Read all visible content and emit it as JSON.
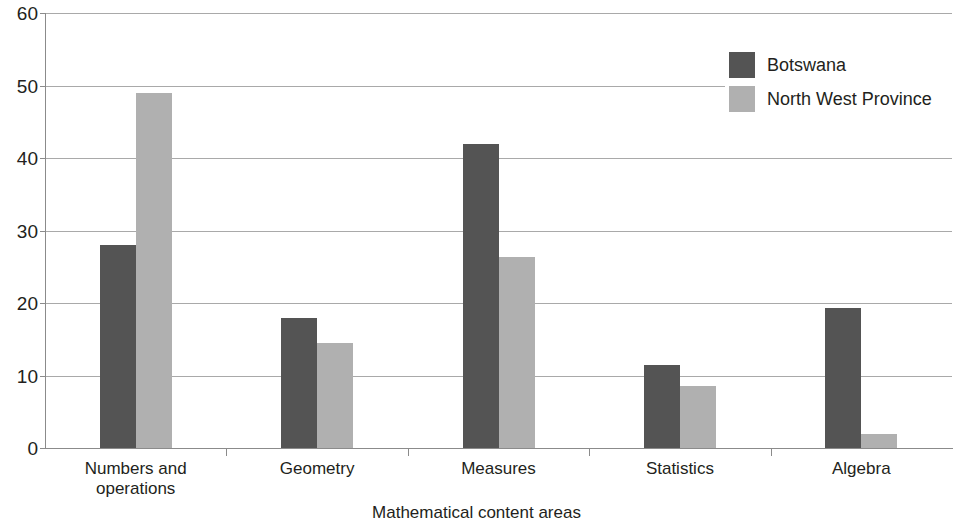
{
  "chart_data": {
    "type": "bar",
    "title": "",
    "subtitle": "",
    "xlabel": "Mathematical content areas",
    "ylabel": "",
    "categories": [
      "Numbers and operations",
      "Geometry",
      "Measures",
      "Statistics",
      "Algebra"
    ],
    "series": [
      {
        "name": "Botswana",
        "color": "#545454",
        "values": [
          28,
          18,
          42,
          11.5,
          19.3
        ]
      },
      {
        "name": "North West Province",
        "color": "#b0b0b0",
        "values": [
          49,
          14.5,
          26.3,
          8.5,
          2
        ]
      }
    ],
    "ylim": [
      0,
      60
    ],
    "yticks": [
      0,
      10,
      20,
      30,
      40,
      50,
      60
    ],
    "ytick_labels": [
      "0",
      "10",
      "20",
      "30",
      "40",
      "50",
      "60"
    ],
    "grid": true,
    "grid_axis": "y",
    "legend_position": "top-right",
    "category_label_lines": [
      [
        "Numbers and",
        "operations"
      ],
      [
        "Geometry"
      ],
      [
        "Measures"
      ],
      [
        "Statistics"
      ],
      [
        "Algebra"
      ]
    ]
  },
  "legend": {
    "entries": [
      {
        "label": "Botswana",
        "color": "#545454"
      },
      {
        "label": "North West Province",
        "color": "#b0b0b0"
      }
    ]
  },
  "axes": {
    "x_title": "Mathematical content areas",
    "y_tick_labels": [
      "60",
      "50",
      "40",
      "30",
      "20",
      "10",
      "0"
    ]
  },
  "colors": {
    "series_dark": "#545454",
    "series_light": "#b0b0b0",
    "gridline": "#a9a9a9",
    "axis": "#8b8b8b",
    "text": "#231f20",
    "background": "#ffffff"
  }
}
